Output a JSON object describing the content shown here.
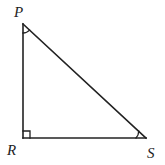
{
  "diagram": {
    "type": "right-triangle",
    "stroke_color": "#222222",
    "vertices": {
      "P": {
        "label": "P",
        "x": 23,
        "y": 24
      },
      "R": {
        "label": "R",
        "x": 23,
        "y": 138
      },
      "S": {
        "label": "S",
        "x": 146,
        "y": 138
      }
    },
    "right_angle_at": "R",
    "angle_marks": [
      "P",
      "S"
    ],
    "labels": {
      "P": "P",
      "R": "R",
      "S": "S"
    }
  }
}
